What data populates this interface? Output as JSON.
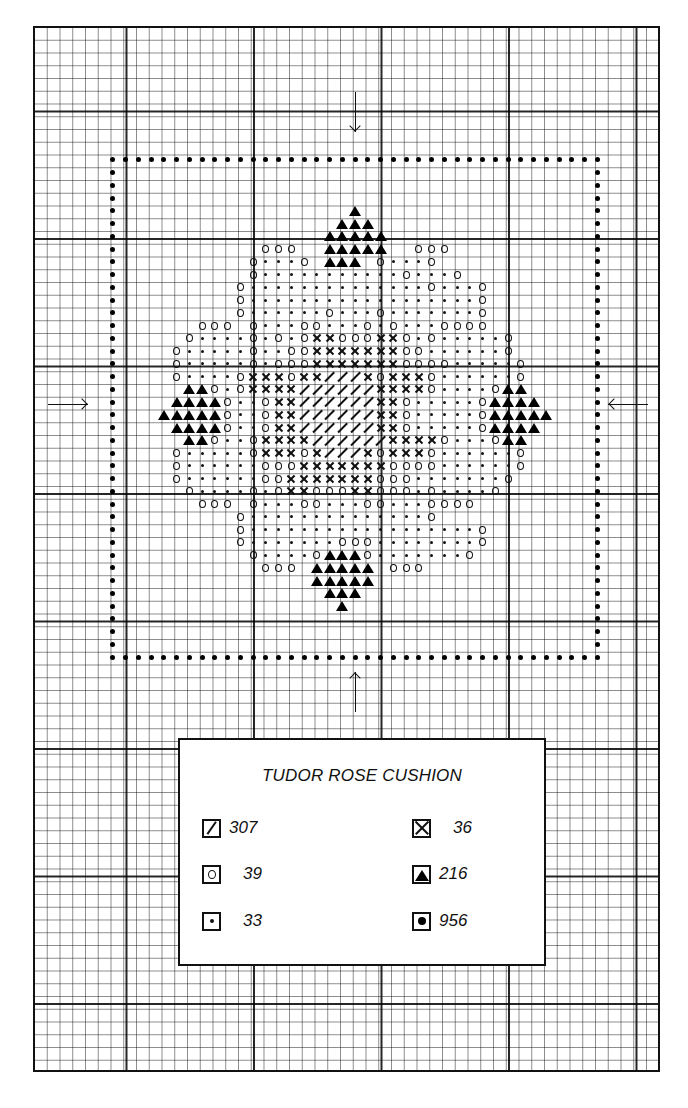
{
  "title": "TUDOR ROSE CUSHION",
  "legend": {
    "title": "TUDOR ROSE CUSHION",
    "items": [
      {
        "symbol": "diagonal",
        "code": "/",
        "label": "307"
      },
      {
        "symbol": "cross",
        "code": "x",
        "label": "36"
      },
      {
        "symbol": "circle",
        "code": "o",
        "label": "39"
      },
      {
        "symbol": "triangle",
        "code": "^",
        "label": "216"
      },
      {
        "symbol": "dot",
        "code": ".",
        "label": "33"
      },
      {
        "symbol": "big-dot",
        "code": "*",
        "label": "956"
      }
    ]
  },
  "grid": {
    "cell_size_px": 12.75,
    "origin_px": [
      30,
      26
    ],
    "major_every": 10,
    "columns": 49,
    "rows": 82
  },
  "border": {
    "symbol": "big-dot",
    "code": "*",
    "left_col": 6,
    "right_col": 44,
    "top_row": 10,
    "bottom_row": 49
  },
  "center_arrows": [
    {
      "direction": "down",
      "col": 25,
      "position": "top"
    },
    {
      "direction": "up",
      "col": 25,
      "position": "bottom"
    },
    {
      "direction": "right",
      "row": 29,
      "position": "left"
    },
    {
      "direction": "left",
      "row": 29,
      "position": "right"
    }
  ],
  "pattern": {
    "origin_col": 10,
    "origin_row": 14,
    "rows": [
      "               ^               ",
      "              ^^^              ",
      "             ^^^^^             ",
      "        ooo  ^^^^^  ooo        ",
      "       o...o ^^^ o...o         ",
      "       o...........o...o       ",
      "      o..............o...o     ",
      "      o..................o     ",
      "      o......o...o.......o     ",
      "   ooo o...oo...o.o...oooo     ",
      "  o....o.o.oxxoooxxo.o.....o   ",
      " o.....o..ooxxxxxxxoo......o  ",
      " o.....o.oooxxxxxxxoooo.....o ",
      " o....oxxxoxx///xoxxxo......o ",
      "  ^^o.oxxxx//////xxxxo....o^^ ",
      " ^^^^o..oxx//////xxo.....o^^^^",
      "^^^^^o..oxx//////xxo.....o^^^^^",
      " ^^^^o..oxx//////xxo.....o^^^^",
      "  ^^o..oxxxx//////xxxxo...o^^ ",
      " o.....oxxxox///xoxxxo......o ",
      " o......oooxxxxxxxoooo......o ",
      " o......ooxxxxxxxooo.......o  ",
      "  o....o.oxxoooxxooo.o....o   ",
      "   ooo o...oo...oo...oooo     ",
      "      o..............o        ",
      "      o..................o     ",
      "      o.......ooo........o     ",
      "       o....o^^^o.......o      ",
      "        ooo ^^^^^ ooo          ",
      "            ^^^^^              ",
      "             ^^^               ",
      "              ^                "
    ]
  }
}
